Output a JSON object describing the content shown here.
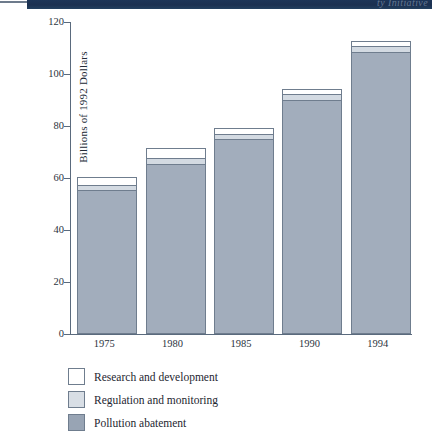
{
  "banner": {
    "title": "ty Initiative"
  },
  "chart_data": {
    "type": "bar",
    "subtype": "stacked-bar",
    "title": "",
    "xlabel": "",
    "ylabel": "Billions of 1992 Dollars",
    "categories": [
      "1975",
      "1980",
      "1985",
      "1990",
      "1994"
    ],
    "ylim": [
      0,
      120
    ],
    "yticks": [
      0,
      20,
      40,
      60,
      80,
      100,
      120
    ],
    "ytick_labels": [
      "0",
      "20",
      "40",
      "60",
      "80",
      "100",
      "120"
    ],
    "grid": false,
    "legend_position": "below",
    "series": [
      {
        "name": "Pollution abatement",
        "color": "#a2adbc",
        "values": [
          55,
          65,
          74.5,
          89.5,
          108
        ]
      },
      {
        "name": "Regulation and monitoring",
        "color": "#d3dae2",
        "values": [
          2,
          2.5,
          2,
          2.5,
          2.5
        ]
      },
      {
        "name": "Research and development",
        "color": "#ffffff",
        "values": [
          3,
          3.5,
          2.5,
          2,
          2
        ]
      }
    ],
    "totals": [
      60,
      71,
      79,
      94,
      112.5
    ]
  },
  "legend": {
    "items": [
      {
        "label": "Research and development",
        "swatch": "research"
      },
      {
        "label": "Regulation and monitoring",
        "swatch": "regulation"
      },
      {
        "label": "Pollution abatement",
        "swatch": "abate"
      }
    ]
  }
}
